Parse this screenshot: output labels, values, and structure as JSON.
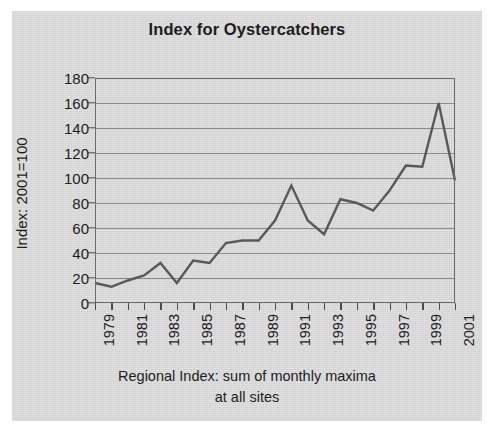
{
  "chart_data": {
    "type": "line",
    "title": "Index for Oystercatchers",
    "xlabel": "Regional Index: sum of monthly maxima at all sites",
    "xlabel_line1": "Regional Index: sum of monthly maxima",
    "xlabel_line2": "at all sites",
    "ylabel": "Index: 2001=100",
    "ylim": [
      0,
      180
    ],
    "ytick_step": 20,
    "ytick_labels": [
      "0",
      "20",
      "40",
      "60",
      "80",
      "100",
      "120",
      "140",
      "160",
      "180"
    ],
    "xlim": [
      1979,
      2001
    ],
    "xtick_labels": [
      "1979",
      "1981",
      "1983",
      "1985",
      "1987",
      "1989",
      "1991",
      "1993",
      "1995",
      "1997",
      "1999",
      "2001"
    ],
    "xtick_label_interval": 2,
    "grid": "horizontal",
    "legend": "none",
    "series_color": "#595959",
    "background_color": "#d7d7d7",
    "x": [
      1979,
      1980,
      1981,
      1982,
      1983,
      1984,
      1985,
      1986,
      1987,
      1988,
      1989,
      1990,
      1991,
      1992,
      1993,
      1994,
      1995,
      1996,
      1997,
      1998,
      1999,
      2000,
      2001
    ],
    "categories": [
      "1979",
      "1980",
      "1981",
      "1982",
      "1983",
      "1984",
      "1985",
      "1986",
      "1987",
      "1988",
      "1989",
      "1990",
      "1991",
      "1992",
      "1993",
      "1994",
      "1995",
      "1996",
      "1997",
      "1998",
      "1999",
      "2000",
      "2001"
    ],
    "values": [
      16,
      13,
      18,
      22,
      32,
      16,
      34,
      32,
      48,
      50,
      50,
      66,
      94,
      66,
      55,
      83,
      80,
      74,
      90,
      110,
      109,
      160,
      98
    ],
    "series": [
      {
        "name": "Index for Oystercatchers",
        "values": [
          16,
          13,
          18,
          22,
          32,
          16,
          34,
          32,
          48,
          50,
          50,
          66,
          94,
          66,
          55,
          83,
          80,
          74,
          90,
          110,
          109,
          160,
          98
        ]
      }
    ]
  }
}
